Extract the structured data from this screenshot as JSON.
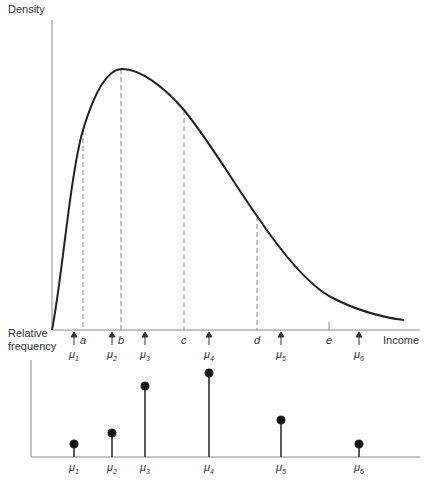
{
  "top_panel": {
    "y_axis_label": "Density",
    "x_axis_label": "Income",
    "points": [
      {
        "label": "a",
        "x": 83,
        "y_curve": 130
      },
      {
        "label": "b",
        "x": 121,
        "y_curve": 69
      },
      {
        "label": "c",
        "x": 184,
        "y_curve": 110
      },
      {
        "label": "d",
        "x": 257,
        "y_curve": 216
      },
      {
        "label": "e",
        "x": 329,
        "tick_only": true
      }
    ],
    "means": [
      {
        "label": "μ",
        "sub": "1",
        "x": 74
      },
      {
        "label": "μ",
        "sub": "2",
        "x": 112
      },
      {
        "label": "μ",
        "sub": "3",
        "x": 145
      },
      {
        "label": "μ",
        "sub": "4",
        "x": 209
      },
      {
        "label": "μ",
        "sub": "5",
        "x": 281
      },
      {
        "label": "μ",
        "sub": "6",
        "x": 359
      }
    ]
  },
  "bottom_panel": {
    "y_axis_label_line1": "Relative",
    "y_axis_label_line2": "frequency",
    "stems": [
      {
        "label": "μ",
        "sub": "1",
        "x": 74,
        "top": 444
      },
      {
        "label": "μ",
        "sub": "2",
        "x": 112,
        "top": 433
      },
      {
        "label": "μ",
        "sub": "3",
        "x": 145,
        "top": 386
      },
      {
        "label": "μ",
        "sub": "4",
        "x": 209,
        "top": 373
      },
      {
        "label": "μ",
        "sub": "5",
        "x": 281,
        "top": 420
      },
      {
        "label": "μ",
        "sub": "6",
        "x": 359,
        "top": 444
      }
    ]
  },
  "colors": {
    "axis": "#888888",
    "curve": "#222222",
    "dashed": "#888888",
    "stem": "#222222",
    "text": "#333333"
  }
}
